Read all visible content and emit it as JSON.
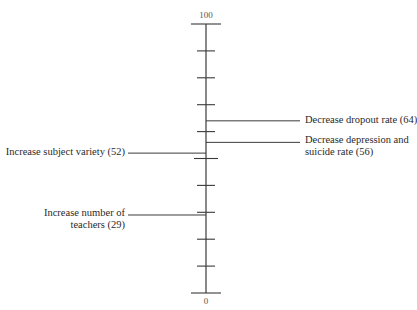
{
  "chart_data": {
    "type": "scale",
    "title": "",
    "axis": {
      "min": 0,
      "max": 100,
      "major_ticks": [
        0,
        10,
        20,
        30,
        40,
        50,
        60,
        70,
        80,
        90,
        100
      ],
      "top_label": "100",
      "bottom_label": "0"
    },
    "items": [
      {
        "label": "Decrease dropout rate (64)",
        "lines": [
          "Decrease dropout rate (64)"
        ],
        "value": 64,
        "side": "right"
      },
      {
        "label": "Decrease depression and suicide rate (56)",
        "lines": [
          "Decrease depression and",
          "suicide rate (56)"
        ],
        "value": 56,
        "side": "right"
      },
      {
        "label": "Increase subject variety (52)",
        "lines": [
          "Increase subject variety (52)"
        ],
        "value": 52,
        "side": "left"
      },
      {
        "label": "Increase number of teachers (29)",
        "lines": [
          "Increase number of",
          "teachers (29)"
        ],
        "value": 29,
        "side": "left"
      }
    ]
  },
  "colors": {
    "line": "#3a3a3a",
    "text": "#2a2a2a"
  }
}
